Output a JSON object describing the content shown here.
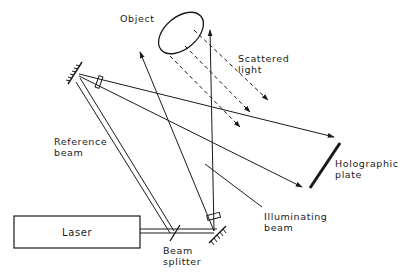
{
  "labels": {
    "object": "Object",
    "scattered_light": [
      "Scattered",
      "light"
    ],
    "reference_beam": [
      "Reference",
      "beam"
    ],
    "holographic_plate": [
      "Holographic",
      "plate"
    ],
    "illuminating_beam": [
      "Illuminating",
      "beam"
    ],
    "laser": "Laser",
    "beam_splitter": [
      "Beam",
      "splitter"
    ]
  },
  "colors": {
    "ink": "#1a1a1a",
    "background": "#ffffff"
  }
}
